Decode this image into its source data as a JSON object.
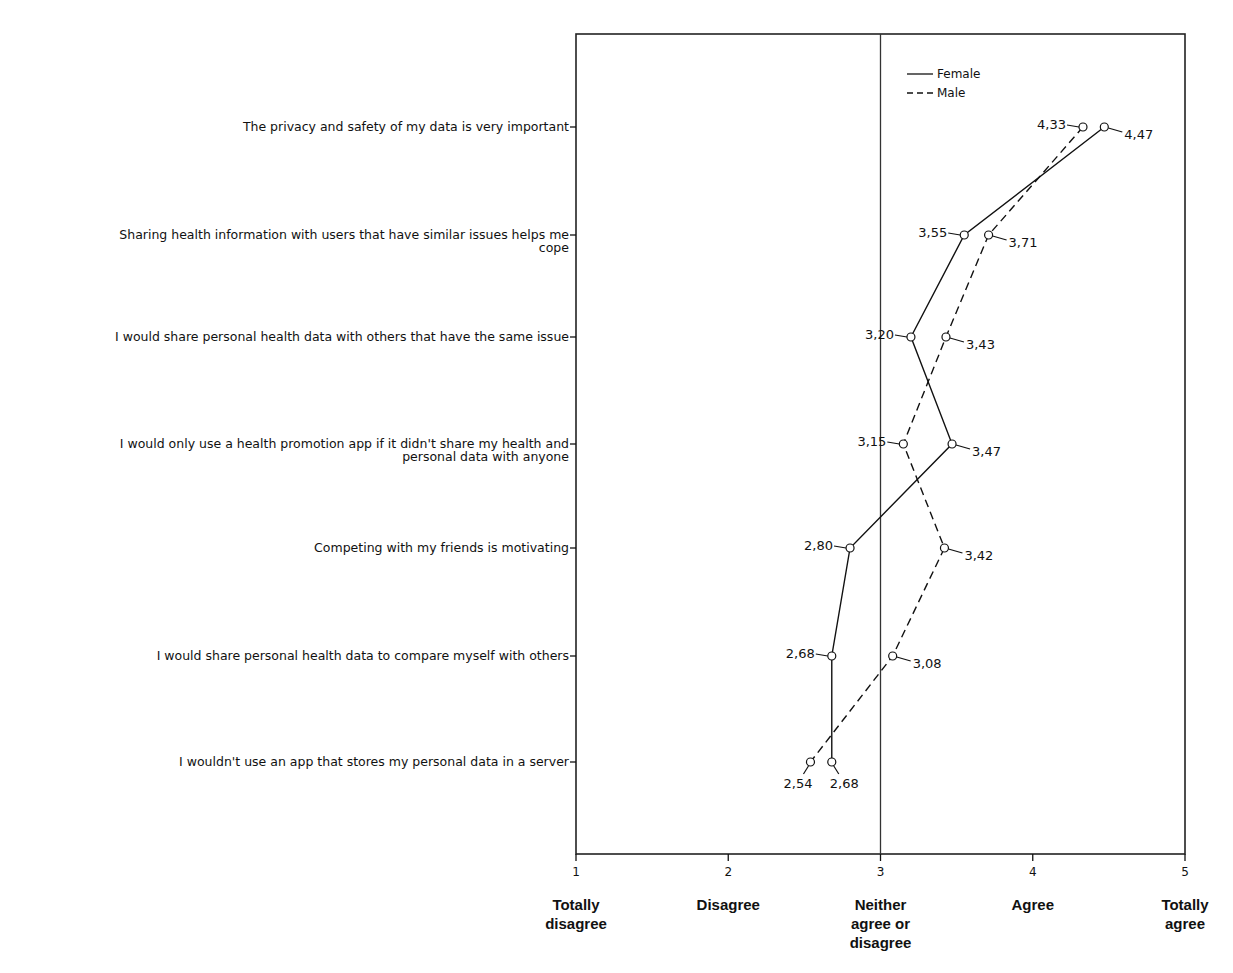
{
  "chart_data": {
    "type": "line",
    "orientation": "horizontal",
    "title": "",
    "xlabel": "",
    "ylabel": "",
    "xlim": [
      1,
      5
    ],
    "x_ticks": [
      1,
      2,
      3,
      4,
      5
    ],
    "x_tick_labels": [
      "1",
      "2",
      "3",
      "4",
      "5"
    ],
    "x_anchor_labels": [
      [
        "Totally",
        "disagree"
      ],
      [
        "Disagree"
      ],
      [
        "Neither",
        "agree or",
        "disagree"
      ],
      [
        "Agree"
      ],
      [
        "Totally",
        "agree"
      ]
    ],
    "reference_line_x": 3,
    "grid": false,
    "legend_position": "top-right-inside",
    "categories": [
      [
        "The privacy and safety of my data is very important"
      ],
      [
        "Sharing health information with users that have similar issues helps me",
        "cope"
      ],
      [
        "I would share personal health data with others that have the same issue"
      ],
      [
        "I would only use a health promotion app if it didn't share my health and",
        "personal data with anyone"
      ],
      [
        "Competing with my friends is motivating"
      ],
      [
        "I would share personal health data to compare myself with others"
      ],
      [
        "I wouldn't use an app that stores my personal data in a server"
      ]
    ],
    "series": [
      {
        "name": "Female",
        "line_style": "solid",
        "values": [
          4.47,
          3.55,
          3.2,
          3.47,
          2.8,
          2.68,
          2.68
        ],
        "labels": [
          "4,47",
          "3,55",
          "3,20",
          "3,47",
          "2,80",
          "2,68",
          "2,68"
        ],
        "label_side": [
          "right",
          "left",
          "left",
          "right",
          "left",
          "left",
          "below-right"
        ]
      },
      {
        "name": "Male",
        "line_style": "dashed",
        "values": [
          4.33,
          3.71,
          3.43,
          3.15,
          3.42,
          3.08,
          2.54
        ],
        "labels": [
          "4,33",
          "3,71",
          "3,43",
          "3,15",
          "3,42",
          "3,08",
          "2,54"
        ],
        "label_side": [
          "left",
          "right",
          "right",
          "left",
          "right",
          "right",
          "below-left"
        ]
      }
    ]
  },
  "legend": {
    "female": "Female",
    "male": "Male"
  },
  "colors": {
    "line": "#111111",
    "frame": "#222222",
    "background": "#ffffff"
  }
}
